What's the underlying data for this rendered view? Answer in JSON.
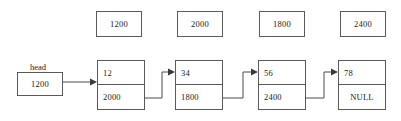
{
  "diagram": {
    "line_color": "#4a4a4a",
    "box_border_color": "#5a5a5a",
    "text_color": "#1a1a1a",
    "background": "#ffffff"
  },
  "head_pointer": {
    "label": "head",
    "value": "1200"
  },
  "address_boxes": [
    {
      "value": "1200"
    },
    {
      "value": "2000"
    },
    {
      "value": "1800"
    },
    {
      "value": "2400"
    }
  ],
  "nodes": [
    {
      "data": "12",
      "next": "2000"
    },
    {
      "data": "34",
      "next": "1800"
    },
    {
      "data": "56",
      "next": "2400"
    },
    {
      "data": "78",
      "next": "NULL"
    }
  ]
}
